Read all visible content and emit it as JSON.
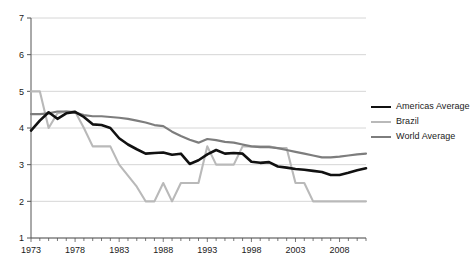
{
  "chart_data": {
    "type": "line",
    "title": "",
    "xlabel": "",
    "ylabel": "",
    "xlim": [
      1973,
      2011
    ],
    "ylim": [
      1,
      7
    ],
    "yticks": [
      1,
      2,
      3,
      4,
      5,
      6,
      7
    ],
    "ytick_labels": [
      "1",
      "2",
      "3",
      "4",
      "5",
      "6",
      "7"
    ],
    "xticks": [
      1973,
      1978,
      1983,
      1988,
      1993,
      1998,
      2003,
      2008
    ],
    "xtick_labels": [
      "1973",
      "1978",
      "1983",
      "1988",
      "1993",
      "1998",
      "2003",
      "2008"
    ],
    "minor_xticks_every": 1,
    "grid": "horizontal",
    "grid_color": "#cccccc",
    "axis_color": "#555555",
    "legend_position": "right",
    "x": [
      1973,
      1974,
      1975,
      1976,
      1977,
      1978,
      1979,
      1980,
      1981,
      1982,
      1983,
      1984,
      1985,
      1986,
      1987,
      1988,
      1989,
      1990,
      1991,
      1992,
      1993,
      1994,
      1995,
      1996,
      1997,
      1998,
      1999,
      2000,
      2001,
      2002,
      2003,
      2004,
      2005,
      2006,
      2007,
      2008,
      2009,
      2010,
      2011
    ],
    "series": [
      {
        "name": "Americas Average",
        "color": "#111111",
        "width": 2.6,
        "values": [
          3.93,
          4.2,
          4.43,
          4.25,
          4.4,
          4.44,
          4.3,
          4.1,
          4.08,
          4.0,
          3.72,
          3.55,
          3.42,
          3.3,
          3.32,
          3.33,
          3.27,
          3.3,
          3.02,
          3.12,
          3.28,
          3.4,
          3.3,
          3.32,
          3.3,
          3.08,
          3.05,
          3.07,
          2.95,
          2.92,
          2.88,
          2.86,
          2.83,
          2.8,
          2.72,
          2.72,
          2.78,
          2.85,
          2.9
        ]
      },
      {
        "name": "Brazil",
        "color": "#b9b9b9",
        "width": 2.1,
        "values": [
          5.0,
          5.0,
          4.0,
          4.4,
          4.45,
          4.45,
          4.0,
          3.5,
          3.5,
          3.5,
          3.0,
          2.7,
          2.4,
          2.0,
          2.0,
          2.5,
          2.0,
          2.5,
          2.5,
          2.5,
          3.5,
          3.0,
          3.0,
          3.0,
          3.5,
          3.5,
          3.5,
          3.5,
          3.45,
          3.45,
          2.5,
          2.5,
          2.0,
          2.0,
          2.0,
          2.0,
          2.0,
          2.0,
          2.0
        ]
      },
      {
        "name": "World Average",
        "color": "#7d7d7d",
        "width": 2.2,
        "values": [
          4.38,
          4.38,
          4.4,
          4.45,
          4.45,
          4.42,
          4.35,
          4.32,
          4.32,
          4.3,
          4.28,
          4.25,
          4.2,
          4.15,
          4.08,
          4.05,
          3.9,
          3.78,
          3.68,
          3.6,
          3.7,
          3.67,
          3.62,
          3.6,
          3.55,
          3.5,
          3.48,
          3.48,
          3.45,
          3.4,
          3.35,
          3.3,
          3.25,
          3.2,
          3.2,
          3.22,
          3.25,
          3.28,
          3.3
        ]
      }
    ],
    "legend": [
      {
        "label": "Americas Average",
        "color": "#111111",
        "width": 2.6
      },
      {
        "label": "Brazil",
        "color": "#b9b9b9",
        "width": 2.1
      },
      {
        "label": "World Average",
        "color": "#7d7d7d",
        "width": 2.2
      }
    ]
  }
}
